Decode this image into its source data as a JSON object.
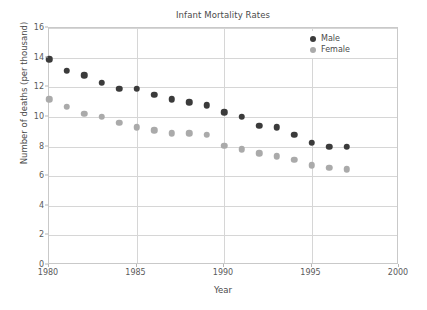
{
  "chart_data": {
    "type": "scatter",
    "title": "Infant Mortality Rates",
    "xlabel": "Year",
    "ylabel": "Number of deaths (per thousand)",
    "xlim": [
      1980,
      2000
    ],
    "ylim": [
      0,
      16
    ],
    "xticks": [
      "1980",
      "1985",
      "1990",
      "1995",
      "2000"
    ],
    "xtick_values": [
      1980,
      1985,
      1990,
      1995,
      2000
    ],
    "yticks": [
      "0",
      "2",
      "4",
      "6",
      "8",
      "10",
      "12",
      "14",
      "16"
    ],
    "ytick_values": [
      0,
      2,
      4,
      6,
      8,
      10,
      12,
      14,
      16
    ],
    "grid": true,
    "legend_position": "top-right",
    "x": [
      1980,
      1981,
      1982,
      1983,
      1984,
      1985,
      1986,
      1987,
      1988,
      1989,
      1990,
      1991,
      1992,
      1993,
      1994,
      1995,
      1996,
      1997
    ],
    "series": [
      {
        "name": "Male",
        "color": "#3b3b3b",
        "values": [
          13.9,
          13.1,
          12.8,
          12.3,
          11.9,
          11.9,
          11.5,
          11.2,
          11.0,
          10.8,
          10.3,
          10.0,
          9.4,
          9.3,
          8.8,
          8.25,
          8.0,
          8.0
        ]
      },
      {
        "name": "Female",
        "color": "#aaaaaa",
        "values": [
          11.2,
          10.7,
          10.2,
          10.0,
          9.6,
          9.3,
          9.1,
          8.9,
          8.9,
          8.8,
          8.05,
          7.8,
          7.55,
          7.35,
          7.1,
          6.75,
          6.55,
          6.45
        ]
      }
    ]
  },
  "legend": {
    "items": [
      {
        "label": "Male"
      },
      {
        "label": "Female"
      }
    ]
  }
}
